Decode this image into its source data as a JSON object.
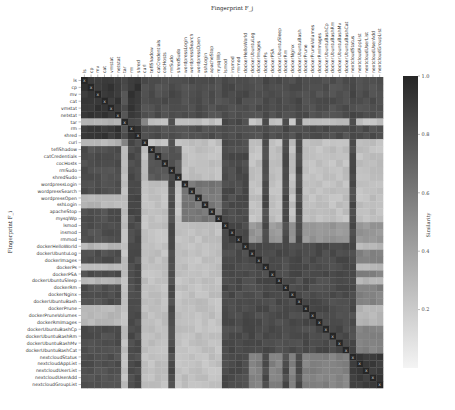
{
  "chart_data": {
    "type": "heatmap",
    "title": "Fingerprint F_j",
    "xlabel": "Fingerprint F_j",
    "ylabel": "Fingerprint F_i",
    "colorbar": {
      "label": "Similarity",
      "range": [
        0.0,
        1.0
      ],
      "ticks": [
        "1.0",
        "0.8",
        "0.6",
        "0.4",
        "0.2"
      ],
      "tick_values": [
        1.0,
        0.8,
        0.6,
        0.4,
        0.2
      ],
      "color_low": "#f4f4f4",
      "color_high": "#262626"
    },
    "labels": [
      "ls",
      "cp",
      "mv",
      "cat",
      "vmstat",
      "netstat",
      "tar",
      "rm",
      "shred",
      "curl",
      "tefiShadow",
      "catCredentials",
      "cocHosts",
      "rmSudo",
      "shredSudo",
      "wordpressLogin",
      "wordpressSearch",
      "wordpressOpen",
      "sshLogin",
      "apacheStop",
      "mysqlWp",
      "lsmod",
      "insmod",
      "rmmod",
      "dockerHelloWorld",
      "dockerUbuntuLog",
      "dockerImages",
      "dockerPs",
      "dockerPSA",
      "dockerUbuntuSleep",
      "dockerRm",
      "dockerNginx",
      "dockerUbuntuBash",
      "dockerPrune",
      "dockerPruneVolumes",
      "dockerRmImages",
      "dockerUbuntuBashCp",
      "dockerUbuntuBashRm",
      "dockerUbuntuBashMv",
      "dockerUbuntuBashCat",
      "nextcloudStatus",
      "nextcloudAppList",
      "nextcloudUserList",
      "nextcloudUserAdd",
      "nextcloudGroupList"
    ],
    "diagonal_marker": "x",
    "groups": [
      {
        "name": "shell-basic",
        "members": [
          "ls",
          "cp",
          "mv",
          "cat",
          "vmstat",
          "netstat",
          "rm",
          "shred"
        ],
        "intra_similarity": 0.92
      },
      {
        "name": "shell-light",
        "members": [
          "tar",
          "curl"
        ],
        "intra_similarity": 0.55
      },
      {
        "name": "privileged",
        "members": [
          "tefiShadow",
          "catCredentials",
          "cocHosts",
          "rmSudo",
          "shredSudo"
        ],
        "intra_similarity": 0.75
      },
      {
        "name": "web",
        "members": [
          "wordpressLogin",
          "wordpressSearch",
          "wordpressOpen",
          "sshLogin",
          "apacheStop",
          "mysqlWp"
        ],
        "intra_similarity": 0.6
      },
      {
        "name": "kernel",
        "members": [
          "lsmod",
          "insmod",
          "rmmod"
        ],
        "intra_similarity": 0.85
      },
      {
        "name": "docker",
        "members": [
          "dockerHelloWorld",
          "dockerUbuntuLog",
          "dockerImages",
          "dockerPs",
          "dockerPSA",
          "dockerUbuntuSleep",
          "dockerRm",
          "dockerNginx",
          "dockerUbuntuBash",
          "dockerPrune",
          "dockerPruneVolumes",
          "dockerRmImages",
          "dockerUbuntuBashCp",
          "dockerUbuntuBashRm",
          "dockerUbuntuBashMv",
          "dockerUbuntuBashCat"
        ],
        "intra_similarity": 0.82
      },
      {
        "name": "nextcloud",
        "members": [
          "nextcloudStatus",
          "nextcloudAppList",
          "nextcloudUserList",
          "nextcloudUserAdd",
          "nextcloudGroupList"
        ],
        "intra_similarity": 0.9
      }
    ],
    "column_similarity_profile": {
      "description": "Column-wise similarity of all rows to each fingerprint (dark vertical bands = universally similar columns)",
      "universally_similar_columns": [
        "rm",
        "shred",
        "rmSudo",
        "lsmod",
        "insmod",
        "rmmod",
        "dockerHelloWorld",
        "dockerPs",
        "dockerRm",
        "dockerUbuntuBash",
        "nextcloudStatus"
      ]
    },
    "light_rows": [
      "tar",
      "curl",
      "wordpressOpen",
      "sshLogin",
      "dockerHelloWorld",
      "dockerPs",
      "dockerUbuntuSleep",
      "dockerPrune",
      "dockerPruneVolumes",
      "dockerRmImages"
    ]
  },
  "caption": ""
}
